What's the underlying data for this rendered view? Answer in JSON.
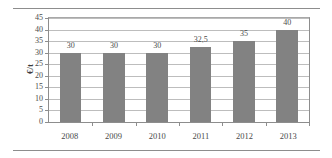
{
  "chart_data": {
    "type": "bar",
    "title": "",
    "xlabel": "",
    "ylabel": "€/t",
    "categories": [
      "2008",
      "2009",
      "2010",
      "2011",
      "2012",
      "2013"
    ],
    "values": [
      30,
      30,
      30,
      32.5,
      35,
      40
    ],
    "value_labels": [
      "30",
      "30",
      "30",
      "32,5",
      "35",
      "40"
    ],
    "ylim": [
      0,
      45
    ],
    "ytick_step": 5,
    "ytick_labels": [
      "0",
      "5",
      "10",
      "15",
      "20",
      "25",
      "30",
      "35",
      "40",
      "45"
    ],
    "grid": true,
    "legend": "none",
    "series": [
      {
        "name": "",
        "values": [
          30,
          30,
          30,
          32.5,
          35,
          40
        ]
      }
    ],
    "colors": {
      "bar": "#828282",
      "gridline": "#bdbdbd",
      "axis": "#8d8d8d",
      "text": "#4a4a4a",
      "background": "#ffffff"
    }
  }
}
